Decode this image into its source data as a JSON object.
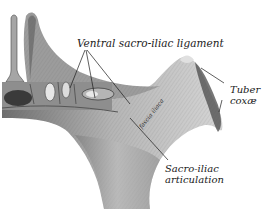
{
  "figure": {
    "colors": {
      "background": "#ffffff",
      "bone_light": "#d8d8d8",
      "bone_mid": "#a8a8a8",
      "bone_dark": "#5a5a5a",
      "ink": "#1a1a1a"
    },
    "labels": {
      "ventral_ligament": "Ventral sacro-iliac ligament",
      "tuber_line1": "Tuber",
      "tuber_line2": "coxæ",
      "sacro_line1": "Sacro-iliac",
      "sacro_line2": "articulation",
      "fascia": "fascia iliaca"
    }
  }
}
